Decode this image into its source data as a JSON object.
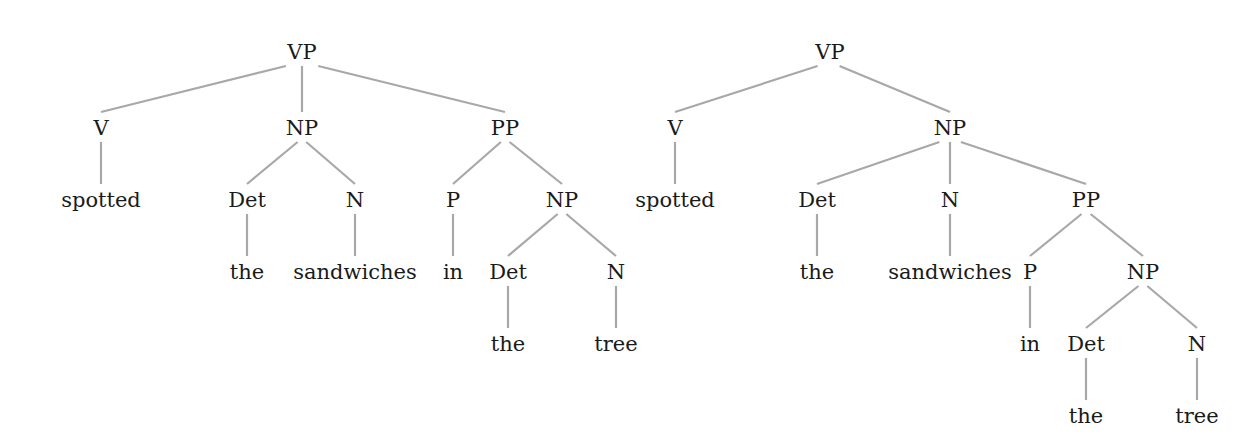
{
  "diagram": {
    "type": "syntax-trees",
    "colors": {
      "text": "#1a1a1a",
      "edge": "#a8a8a8",
      "background": "#ffffff"
    },
    "trees": [
      {
        "id": "left",
        "nodes": [
          {
            "id": "l0",
            "label": "VP",
            "x": 302,
            "y": 52
          },
          {
            "id": "l1",
            "label": "V",
            "x": 101,
            "y": 128
          },
          {
            "id": "l2",
            "label": "NP",
            "x": 302,
            "y": 128
          },
          {
            "id": "l3",
            "label": "PP",
            "x": 505,
            "y": 128
          },
          {
            "id": "l4",
            "label": "spotted",
            "x": 101,
            "y": 200
          },
          {
            "id": "l5",
            "label": "Det",
            "x": 247,
            "y": 200
          },
          {
            "id": "l6",
            "label": "N",
            "x": 355,
            "y": 200
          },
          {
            "id": "l7",
            "label": "P",
            "x": 453,
            "y": 200
          },
          {
            "id": "l8",
            "label": "NP",
            "x": 562,
            "y": 200
          },
          {
            "id": "l9",
            "label": "the",
            "x": 247,
            "y": 272
          },
          {
            "id": "l10",
            "label": "sandwiches",
            "x": 355,
            "y": 272
          },
          {
            "id": "l11",
            "label": "in",
            "x": 453,
            "y": 272
          },
          {
            "id": "l12",
            "label": "Det",
            "x": 508,
            "y": 272
          },
          {
            "id": "l13",
            "label": "N",
            "x": 616,
            "y": 272
          },
          {
            "id": "l14",
            "label": "the",
            "x": 508,
            "y": 344
          },
          {
            "id": "l15",
            "label": "tree",
            "x": 616,
            "y": 344
          }
        ],
        "edges": [
          [
            "l0",
            "l1"
          ],
          [
            "l0",
            "l2"
          ],
          [
            "l0",
            "l3"
          ],
          [
            "l1",
            "l4"
          ],
          [
            "l2",
            "l5"
          ],
          [
            "l2",
            "l6"
          ],
          [
            "l3",
            "l7"
          ],
          [
            "l3",
            "l8"
          ],
          [
            "l5",
            "l9"
          ],
          [
            "l6",
            "l10"
          ],
          [
            "l7",
            "l11"
          ],
          [
            "l8",
            "l12"
          ],
          [
            "l8",
            "l13"
          ],
          [
            "l12",
            "l14"
          ],
          [
            "l13",
            "l15"
          ]
        ]
      },
      {
        "id": "right",
        "nodes": [
          {
            "id": "r0",
            "label": "VP",
            "x": 830,
            "y": 52
          },
          {
            "id": "r1",
            "label": "V",
            "x": 675,
            "y": 128
          },
          {
            "id": "r2",
            "label": "NP",
            "x": 950,
            "y": 128
          },
          {
            "id": "r3",
            "label": "spotted",
            "x": 675,
            "y": 200
          },
          {
            "id": "r4",
            "label": "Det",
            "x": 817,
            "y": 200
          },
          {
            "id": "r5",
            "label": "N",
            "x": 950,
            "y": 200
          },
          {
            "id": "r6",
            "label": "PP",
            "x": 1086,
            "y": 200
          },
          {
            "id": "r7",
            "label": "the",
            "x": 817,
            "y": 272
          },
          {
            "id": "r8",
            "label": "sandwiches",
            "x": 950,
            "y": 272
          },
          {
            "id": "r9",
            "label": "P",
            "x": 1030,
            "y": 272
          },
          {
            "id": "r10",
            "label": "NP",
            "x": 1143,
            "y": 272
          },
          {
            "id": "r11",
            "label": "in",
            "x": 1030,
            "y": 344
          },
          {
            "id": "r12",
            "label": "Det",
            "x": 1086,
            "y": 344
          },
          {
            "id": "r13",
            "label": "N",
            "x": 1197,
            "y": 344
          },
          {
            "id": "r14",
            "label": "the",
            "x": 1086,
            "y": 416
          },
          {
            "id": "r15",
            "label": "tree",
            "x": 1197,
            "y": 416
          }
        ],
        "edges": [
          [
            "r0",
            "r1"
          ],
          [
            "r0",
            "r2"
          ],
          [
            "r1",
            "r3"
          ],
          [
            "r2",
            "r4"
          ],
          [
            "r2",
            "r5"
          ],
          [
            "r2",
            "r6"
          ],
          [
            "r4",
            "r7"
          ],
          [
            "r5",
            "r8"
          ],
          [
            "r6",
            "r9"
          ],
          [
            "r6",
            "r10"
          ],
          [
            "r9",
            "r11"
          ],
          [
            "r10",
            "r12"
          ],
          [
            "r10",
            "r13"
          ],
          [
            "r12",
            "r14"
          ],
          [
            "r13",
            "r15"
          ]
        ]
      }
    ]
  }
}
